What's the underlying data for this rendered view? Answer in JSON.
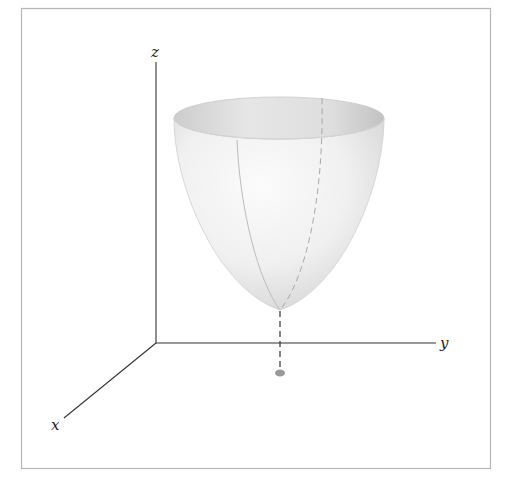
{
  "figure": {
    "axes": {
      "x_label": "x",
      "y_label": "y",
      "z_label": "z"
    },
    "colors": {
      "frame": "#b5b5b5",
      "axis": "#333333",
      "surface_light": "#f7f7f7",
      "surface_shade": "#d9d9d9",
      "surface_dark": "#c4c4c4",
      "dot": "#9a9a9a"
    },
    "elements": {
      "surface": "paraboloid",
      "vertex_projection": "dashed vertical line",
      "projection_point": "dot on xy-plane"
    }
  }
}
